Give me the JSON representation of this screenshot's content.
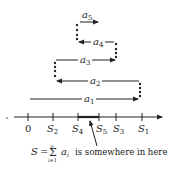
{
  "diagram": {
    "type": "alternating-series-partial-sums",
    "terms": [
      {
        "label": "a",
        "sub": "1",
        "direction": "right"
      },
      {
        "label": "a",
        "sub": "2",
        "direction": "left"
      },
      {
        "label": "a",
        "sub": "3",
        "direction": "right"
      },
      {
        "label": "a",
        "sub": "4",
        "direction": "left"
      },
      {
        "label": "a",
        "sub": "5",
        "direction": "right"
      }
    ],
    "axis": {
      "ticks": [
        {
          "label": "0",
          "sub": ""
        },
        {
          "label": "S",
          "sub": "2"
        },
        {
          "label": "S",
          "sub": "4"
        },
        {
          "label": "S",
          "sub": "5"
        },
        {
          "label": "S",
          "sub": "3"
        },
        {
          "label": "S",
          "sub": "1"
        }
      ]
    },
    "caption": {
      "lhs": "S",
      "eq": "=",
      "sigma": "Σ",
      "upper": "∞",
      "lower": "i=1",
      "term": "a",
      "term_sub": "i",
      "text": "is somewhere in here"
    },
    "colors": {
      "ink": "#222222",
      "background": "#ffffff"
    }
  }
}
